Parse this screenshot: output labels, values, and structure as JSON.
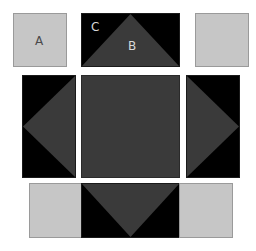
{
  "diagram": {
    "title": "",
    "colors": {
      "background": "#ffffff",
      "light_gray": "#c6c6c6",
      "dark_gray": "#3a3a3a",
      "black": "#000000"
    },
    "labels": {
      "a": "A",
      "b": "B",
      "c": "C"
    },
    "tiles": [
      {
        "id": "top-left",
        "fill": "light_gray",
        "label": "A"
      },
      {
        "id": "top-center",
        "fill": "black",
        "triangle": "up",
        "labels": [
          "C",
          "B"
        ]
      },
      {
        "id": "top-right",
        "fill": "light_gray"
      },
      {
        "id": "middle-left",
        "fill": "black",
        "triangle": "left"
      },
      {
        "id": "center",
        "fill": "dark_gray"
      },
      {
        "id": "middle-right",
        "fill": "black",
        "triangle": "right"
      },
      {
        "id": "bottom-left",
        "fill": "light_gray"
      },
      {
        "id": "bottom-center",
        "fill": "black",
        "triangle": "down"
      },
      {
        "id": "bottom-right",
        "fill": "light_gray"
      }
    ]
  }
}
